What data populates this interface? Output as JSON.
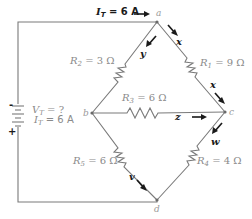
{
  "diagram": {
    "type": "circuit-schematic",
    "source": {
      "voltage_label": "V",
      "voltage_sub": "T",
      "voltage_value": " = ?",
      "current_label": "I",
      "current_sub": "T",
      "current_value": " = 6 A",
      "negative_sign": "-",
      "positive_sign": "+"
    },
    "top_current": {
      "label": "I",
      "sub": "T",
      "value": " = 6 A"
    },
    "nodes": [
      {
        "id": "a",
        "label": "a"
      },
      {
        "id": "b",
        "label": "b"
      },
      {
        "id": "c",
        "label": "c"
      },
      {
        "id": "d",
        "label": "d"
      }
    ],
    "resistors": [
      {
        "name": "R",
        "sub": "1",
        "value": " = 9 Ω",
        "from": "a",
        "to": "c"
      },
      {
        "name": "R",
        "sub": "2",
        "value": " = 3 Ω",
        "from": "a",
        "to": "b"
      },
      {
        "name": "R",
        "sub": "3",
        "value": " = 6 Ω",
        "from": "b",
        "to": "c"
      },
      {
        "name": "R",
        "sub": "4",
        "value": " = 4 Ω",
        "from": "c",
        "to": "d"
      },
      {
        "name": "R",
        "sub": "5",
        "value": " = 6 Ω",
        "from": "b",
        "to": "d"
      }
    ],
    "branch_currents": [
      {
        "label": "x",
        "branch": "a-c (upper)"
      },
      {
        "label": "x",
        "branch": "a-c (lower)"
      },
      {
        "label": "y",
        "branch": "a-b"
      },
      {
        "label": "z",
        "branch": "b-c"
      },
      {
        "label": "w",
        "branch": "c-d"
      },
      {
        "label": "v",
        "branch": "b-d"
      }
    ]
  }
}
